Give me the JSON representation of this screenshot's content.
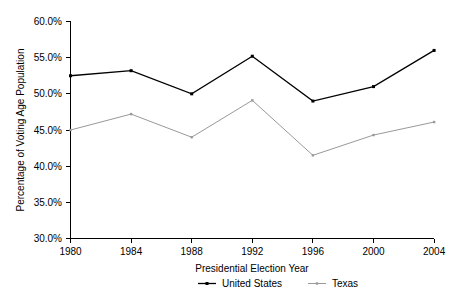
{
  "chart_data": {
    "type": "line",
    "title": "",
    "xlabel": "Presidential Election Year",
    "ylabel": "Percentage of Voting Age Population",
    "categories": [
      "1980",
      "1984",
      "1988",
      "1992",
      "1996",
      "2000",
      "2004"
    ],
    "x": [
      1980,
      1984,
      1988,
      1992,
      1996,
      2000,
      2004
    ],
    "xlim": [
      1980,
      2004
    ],
    "ylim": [
      30,
      60
    ],
    "ytick_values": [
      30,
      35,
      40,
      45,
      50,
      55,
      60
    ],
    "ytick_labels": [
      "30.0%",
      "35.0%",
      "40.0%",
      "45.0%",
      "50.0%",
      "55.0%",
      "60.0%"
    ],
    "xtick_labels": [
      "1980",
      "1984",
      "1988",
      "1992",
      "1996",
      "2000",
      "2004"
    ],
    "grid": false,
    "legend_position": "bottom",
    "series": [
      {
        "name": "United States",
        "color": "#000000",
        "marker": "square",
        "values": [
          52.5,
          53.2,
          50.0,
          55.2,
          49.0,
          51.0,
          56.0
        ]
      },
      {
        "name": "Texas",
        "color": "#999999",
        "marker": "square",
        "values": [
          45.0,
          47.2,
          44.0,
          49.1,
          41.5,
          44.3,
          46.1
        ]
      }
    ]
  },
  "legend": {
    "items": [
      {
        "label": "United States",
        "color": "#000000"
      },
      {
        "label": "Texas",
        "color": "#999999"
      }
    ]
  },
  "axes": {
    "y_title": "Percentage of Voting Age Population",
    "x_title": "Presidential Election Year"
  }
}
